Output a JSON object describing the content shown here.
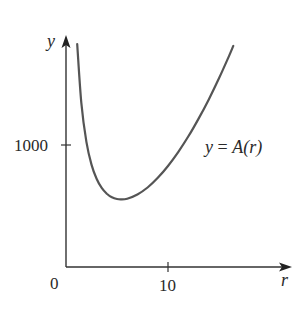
{
  "chart_data": {
    "type": "line",
    "title": "",
    "xlabel": "r",
    "ylabel": "y",
    "origin_label": "0",
    "x_ticks": [
      {
        "value": 10,
        "label": "10"
      }
    ],
    "y_ticks": [
      {
        "value": 1000,
        "label": "1000"
      }
    ],
    "xlim": [
      0,
      21.5
    ],
    "ylim": [
      0,
      1900
    ],
    "grid": false,
    "legend": "none",
    "annotations": [
      {
        "text": "y = A(r)",
        "near": {
          "r": 17.5,
          "y": 870
        }
      }
    ],
    "series": [
      {
        "name": "y = A(r)",
        "x": [
          1.1,
          1.5,
          2,
          2.5,
          3,
          3.5,
          4,
          4.5,
          5,
          5.42,
          6,
          7,
          8,
          9,
          10,
          11,
          12,
          13,
          14,
          15,
          16,
          16.4
        ],
        "y": [
          1826,
          1347,
          1025,
          839,
          723,
          648,
          601,
          571,
          557,
          554,
          560,
          594,
          652,
          731,
          828,
          942,
          1071,
          1216,
          1374,
          1547,
          1733,
          1812
        ]
      }
    ]
  },
  "labels": {
    "y_axis": "y",
    "x_axis": "r",
    "origin": "0",
    "y_tick_1000": "1000",
    "x_tick_10": "10",
    "curve_label_lhs": "y",
    "curve_label_eq": " = ",
    "curve_label_rhs": "A(r)"
  },
  "colors": {
    "axis": "#333333",
    "curve": "#555555",
    "text": "#2a2a2a"
  }
}
